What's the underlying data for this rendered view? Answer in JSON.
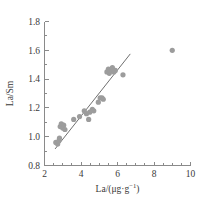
{
  "chart_data": {
    "type": "scatter",
    "title": "",
    "subtitle": "",
    "xlabel": "La/(μg·g⁻¹)",
    "xlabel_base": "La/(μg·g",
    "xlabel_sup": "−1",
    "xlabel_tail": ")",
    "ylabel": "La/Sm",
    "xlim": [
      2,
      10
    ],
    "ylim": [
      0.8,
      1.8
    ],
    "x_major_ticks": [
      2,
      4,
      6,
      8,
      10
    ],
    "x_major_tick_labels": [
      "2",
      "4",
      "6",
      "8",
      "10"
    ],
    "x_minor_ticks": [
      2.5,
      3,
      3.5,
      4.5,
      5,
      5.5,
      6.5,
      7,
      7.5,
      8.5,
      9,
      9.5
    ],
    "y_major_ticks": [
      0.8,
      1.0,
      1.2,
      1.4,
      1.6,
      1.8
    ],
    "y_major_tick_labels": [
      "0.8",
      "1.0",
      "1.2",
      "1.4",
      "1.6",
      "1.8"
    ],
    "y_minor_ticks": [
      0.9,
      1.1,
      1.3,
      1.5,
      1.7
    ],
    "grid": false,
    "legend": null,
    "legend_position": "none",
    "marker_color": "#9c9c9c",
    "line_color": "#6f6f6f",
    "axis_color": "#8a8a8a",
    "marker_radius": 2.6,
    "series": [
      {
        "name": "samples",
        "marker": "circle",
        "points": [
          [
            2.62,
            0.96
          ],
          [
            2.72,
            0.95
          ],
          [
            2.78,
            0.97
          ],
          [
            2.82,
            0.99
          ],
          [
            2.86,
            1.07
          ],
          [
            2.92,
            1.09
          ],
          [
            3.0,
            1.06
          ],
          [
            3.05,
            1.08
          ],
          [
            3.12,
            1.05
          ],
          [
            3.6,
            1.12
          ],
          [
            3.92,
            1.14
          ],
          [
            4.18,
            1.18
          ],
          [
            4.3,
            1.16
          ],
          [
            4.42,
            1.12
          ],
          [
            4.48,
            1.17
          ],
          [
            4.62,
            1.19
          ],
          [
            4.7,
            1.18
          ],
          [
            4.95,
            1.24
          ],
          [
            5.05,
            1.27
          ],
          [
            5.15,
            1.27
          ],
          [
            5.22,
            1.26
          ],
          [
            5.42,
            1.45
          ],
          [
            5.5,
            1.47
          ],
          [
            5.55,
            1.44
          ],
          [
            5.62,
            1.46
          ],
          [
            5.72,
            1.48
          ],
          [
            5.8,
            1.45
          ],
          [
            5.88,
            1.46
          ],
          [
            6.3,
            1.43
          ],
          [
            9.0,
            1.6
          ]
        ]
      }
    ],
    "fit_line": {
      "name": "regression-line",
      "x_start": 2.58,
      "y_start": 0.915,
      "x_end": 6.7,
      "y_end": 1.575
    }
  }
}
